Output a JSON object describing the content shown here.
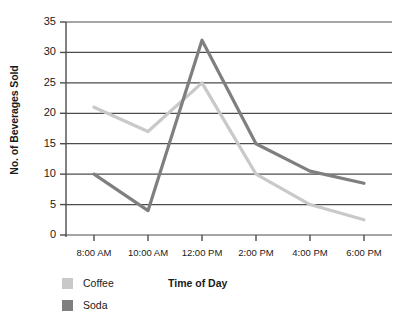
{
  "chart_data": {
    "type": "line",
    "title": "",
    "xlabel": "Time of Day",
    "ylabel": "No. of Beverages Sold",
    "categories": [
      "8:00 AM",
      "10:00 AM",
      "12:00 PM",
      "2:00 PM",
      "4:00 PM",
      "6:00 PM"
    ],
    "series": [
      {
        "name": "Coffee",
        "color": "#c9c9c9",
        "values": [
          21,
          17,
          25,
          10,
          5,
          2.5
        ]
      },
      {
        "name": "Soda",
        "color": "#7f7f7f",
        "values": [
          10,
          4,
          32,
          15,
          10.5,
          8.5
        ]
      }
    ],
    "ylim": [
      0,
      35
    ],
    "yticks": [
      0,
      5,
      10,
      15,
      20,
      25,
      30,
      35
    ],
    "ytick_labels": [
      "0",
      "5",
      "10",
      "15",
      "20",
      "25",
      "30",
      "35"
    ],
    "grid": true,
    "grid_axis": "y",
    "legend_position": "bottom-left",
    "axis_color": "#4d4d4d",
    "grid_color": "#4d4d4d"
  },
  "legend": {
    "items": [
      {
        "label": "Coffee",
        "swatch": "#c9c9c9"
      },
      {
        "label": "Soda",
        "swatch": "#7f7f7f"
      }
    ]
  }
}
